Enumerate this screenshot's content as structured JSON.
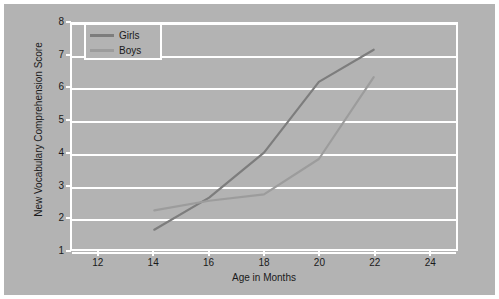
{
  "chart_data": {
    "type": "line",
    "title": "",
    "xlabel": "Age in Months",
    "ylabel": "New Vocabulary Comprehension Score",
    "x": [
      14,
      16,
      18,
      20,
      22
    ],
    "xlim": [
      11,
      25
    ],
    "ylim": [
      1,
      8
    ],
    "xticks": [
      12,
      14,
      16,
      18,
      20,
      22,
      24
    ],
    "yticks": [
      1,
      2,
      3,
      4,
      5,
      6,
      7,
      8
    ],
    "xticklabels": [
      "12",
      "14",
      "16",
      "18",
      "20",
      "22",
      "24"
    ],
    "yticklabels": [
      "1",
      "2",
      "3",
      "4",
      "5",
      "6",
      "7",
      "8"
    ],
    "grid": "horizontal",
    "legend_position": "upper left",
    "series": [
      {
        "name": "Girls",
        "color": "#7d7d7d",
        "values": [
          1.6,
          2.6,
          4.0,
          6.2,
          7.2
        ]
      },
      {
        "name": "Boys",
        "color": "#9c9c9c",
        "values": [
          2.2,
          2.5,
          2.7,
          3.8,
          6.35
        ]
      }
    ],
    "background_color": "#b3b3b3",
    "grid_color": "#ffffff",
    "text_color": "#1a1a1a"
  },
  "axis": {
    "x_title": "Age in Months",
    "y_title": "New Vocabulary Comprehension Score"
  },
  "legend": {
    "items": [
      {
        "label": "Girls"
      },
      {
        "label": "Boys"
      }
    ]
  }
}
